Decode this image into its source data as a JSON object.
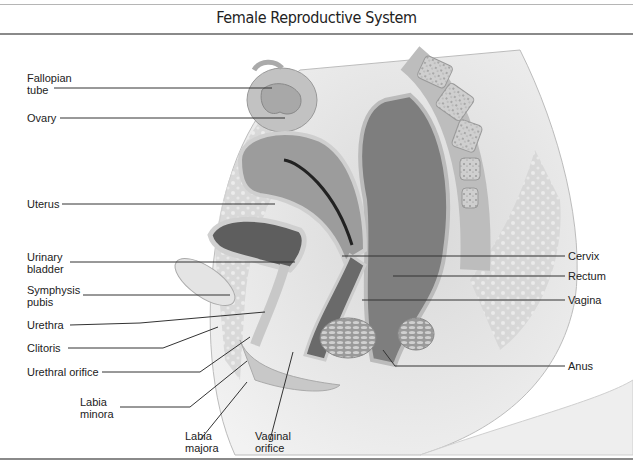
{
  "title": "Female Reproductive System",
  "labels": {
    "fallopian_tube": "Fallopian\ntube",
    "ovary": "Ovary",
    "uterus": "Uterus",
    "urinary_bladder": "Urinary\nbladder",
    "symphysis_pubis": "Symphysis\npubis",
    "urethra": "Urethra",
    "clitoris": "Clitoris",
    "urethral_orifice": "Urethral orifice",
    "labia_minora": "Labia\nminora",
    "labia_majora": "Labia\nmajora",
    "vaginal_orifice": "Vaginal\norifice",
    "cervix": "Cervix",
    "rectum": "Rectum",
    "vagina": "Vagina",
    "anus": "Anus"
  },
  "colors": {
    "tissue_light": "#e6e6e6",
    "tissue_mid": "#bdbdbd",
    "tissue_dark": "#7a7a7a",
    "leader_line": "#333333"
  }
}
